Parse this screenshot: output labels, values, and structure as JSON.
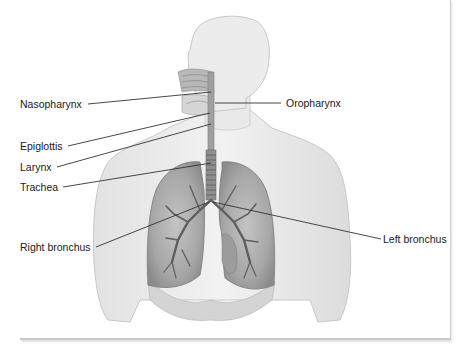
{
  "diagram": {
    "labels": {
      "nasopharynx": "Nasopharynx",
      "oropharynx": "Oropharynx",
      "epiglottis": "Epiglottis",
      "larynx": "Larynx",
      "trachea": "Trachea",
      "right_bronchus": "Right bronchus",
      "left_bronchus": "Left bronchus"
    },
    "colors": {
      "skin": "#ececec",
      "skin_outline": "#c8c8c8",
      "lung": "#a9a9a9",
      "lung_dark": "#7d7d7d",
      "airway": "#8a8a8a",
      "leader_line": "#333333",
      "text": "#1a1a1a"
    }
  }
}
